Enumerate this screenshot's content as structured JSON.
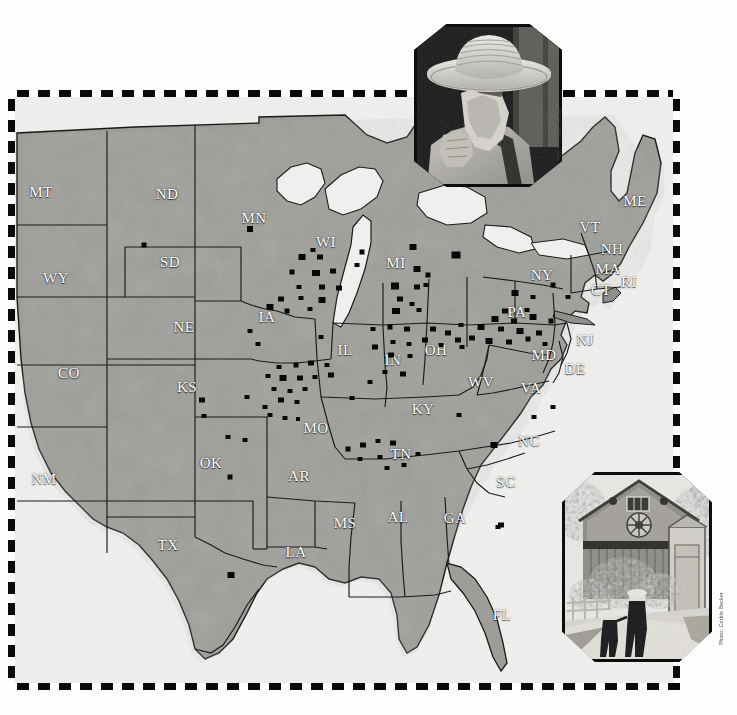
{
  "page": {
    "background_color": "#fdfdfd",
    "frame_color": "#0a0a0a",
    "land_color": "#9a9a96",
    "water_color": "#efefed",
    "dot_color": "#080808",
    "label_color": "#ffffff"
  },
  "map": {
    "name": "united-states-settlement-map",
    "projection_note": "contiguous united states",
    "state_labels": [
      {
        "abbr": "MT",
        "x": 26,
        "y": 95
      },
      {
        "abbr": "ND",
        "x": 152,
        "y": 97
      },
      {
        "abbr": "MN",
        "x": 239,
        "y": 121
      },
      {
        "abbr": "WI",
        "x": 311,
        "y": 145
      },
      {
        "abbr": "MI",
        "x": 381,
        "y": 166
      },
      {
        "abbr": "ME",
        "x": 620,
        "y": 104
      },
      {
        "abbr": "VT",
        "x": 575,
        "y": 130
      },
      {
        "abbr": "NH",
        "x": 597,
        "y": 152
      },
      {
        "abbr": "MA",
        "x": 593,
        "y": 172
      },
      {
        "abbr": "RI",
        "x": 614,
        "y": 185
      },
      {
        "abbr": "CT",
        "x": 586,
        "y": 193
      },
      {
        "abbr": "NY",
        "x": 527,
        "y": 178
      },
      {
        "abbr": "PA",
        "x": 502,
        "y": 215
      },
      {
        "abbr": "WY",
        "x": 41,
        "y": 181
      },
      {
        "abbr": "SD",
        "x": 155,
        "y": 165
      },
      {
        "abbr": "IA",
        "x": 252,
        "y": 220
      },
      {
        "abbr": "NE",
        "x": 169,
        "y": 230
      },
      {
        "abbr": "IL",
        "x": 330,
        "y": 253
      },
      {
        "abbr": "IN",
        "x": 378,
        "y": 263
      },
      {
        "abbr": "OH",
        "x": 421,
        "y": 253
      },
      {
        "abbr": "NJ",
        "x": 570,
        "y": 243
      },
      {
        "abbr": "MD",
        "x": 529,
        "y": 258
      },
      {
        "abbr": "DE",
        "x": 560,
        "y": 272
      },
      {
        "abbr": "WV",
        "x": 466,
        "y": 285
      },
      {
        "abbr": "VA",
        "x": 516,
        "y": 291
      },
      {
        "abbr": "CO",
        "x": 54,
        "y": 276
      },
      {
        "abbr": "KS",
        "x": 172,
        "y": 290
      },
      {
        "abbr": "MO",
        "x": 301,
        "y": 331
      },
      {
        "abbr": "KY",
        "x": 408,
        "y": 312
      },
      {
        "abbr": "TN",
        "x": 386,
        "y": 357
      },
      {
        "abbr": "NC",
        "x": 514,
        "y": 344
      },
      {
        "abbr": "SC",
        "x": 491,
        "y": 385
      },
      {
        "abbr": "NM",
        "x": 29,
        "y": 382
      },
      {
        "abbr": "OK",
        "x": 196,
        "y": 366
      },
      {
        "abbr": "AR",
        "x": 284,
        "y": 379
      },
      {
        "abbr": "TX",
        "x": 153,
        "y": 448
      },
      {
        "abbr": "LA",
        "x": 281,
        "y": 455
      },
      {
        "abbr": "MS",
        "x": 330,
        "y": 426
      },
      {
        "abbr": "AL",
        "x": 383,
        "y": 420
      },
      {
        "abbr": "GA",
        "x": 440,
        "y": 421
      },
      {
        "abbr": "FL",
        "x": 487,
        "y": 518
      }
    ],
    "settlement_dots": [
      {
        "x": 235,
        "y": 132,
        "w": 6,
        "h": 6
      },
      {
        "x": 129,
        "y": 148,
        "w": 5,
        "h": 5
      },
      {
        "x": 287,
        "y": 160,
        "w": 7,
        "h": 6
      },
      {
        "x": 305,
        "y": 160,
        "w": 6,
        "h": 5
      },
      {
        "x": 298,
        "y": 153,
        "w": 5,
        "h": 4
      },
      {
        "x": 347,
        "y": 155,
        "w": 5,
        "h": 5
      },
      {
        "x": 441,
        "y": 158,
        "w": 9,
        "h": 7
      },
      {
        "x": 398,
        "y": 150,
        "w": 7,
        "h": 6
      },
      {
        "x": 301,
        "y": 176,
        "w": 8,
        "h": 6
      },
      {
        "x": 318,
        "y": 174,
        "w": 6,
        "h": 5
      },
      {
        "x": 277,
        "y": 175,
        "w": 5,
        "h": 5
      },
      {
        "x": 342,
        "y": 168,
        "w": 5,
        "h": 4
      },
      {
        "x": 402,
        "y": 172,
        "w": 7,
        "h": 6
      },
      {
        "x": 413,
        "y": 178,
        "w": 5,
        "h": 5
      },
      {
        "x": 284,
        "y": 190,
        "w": 5,
        "h": 4
      },
      {
        "x": 307,
        "y": 190,
        "w": 6,
        "h": 5
      },
      {
        "x": 324,
        "y": 191,
        "w": 6,
        "h": 5
      },
      {
        "x": 380,
        "y": 189,
        "w": 8,
        "h": 7
      },
      {
        "x": 402,
        "y": 190,
        "w": 6,
        "h": 5
      },
      {
        "x": 411,
        "y": 188,
        "w": 5,
        "h": 4
      },
      {
        "x": 266,
        "y": 202,
        "w": 6,
        "h": 5
      },
      {
        "x": 286,
        "y": 201,
        "w": 5,
        "h": 4
      },
      {
        "x": 307,
        "y": 203,
        "w": 7,
        "h": 6
      },
      {
        "x": 385,
        "y": 202,
        "w": 6,
        "h": 5
      },
      {
        "x": 397,
        "y": 207,
        "w": 5,
        "h": 4
      },
      {
        "x": 255,
        "y": 210,
        "w": 7,
        "h": 6
      },
      {
        "x": 272,
        "y": 214,
        "w": 5,
        "h": 5
      },
      {
        "x": 295,
        "y": 212,
        "w": 5,
        "h": 4
      },
      {
        "x": 381,
        "y": 214,
        "w": 8,
        "h": 6
      },
      {
        "x": 404,
        "y": 213,
        "w": 5,
        "h": 4
      },
      {
        "x": 500,
        "y": 196,
        "w": 7,
        "h": 6
      },
      {
        "x": 518,
        "y": 200,
        "w": 5,
        "h": 4
      },
      {
        "x": 538,
        "y": 188,
        "w": 5,
        "h": 5
      },
      {
        "x": 553,
        "y": 200,
        "w": 5,
        "h": 4
      },
      {
        "x": 490,
        "y": 214,
        "w": 6,
        "h": 5
      },
      {
        "x": 512,
        "y": 213,
        "w": 5,
        "h": 4
      },
      {
        "x": 480,
        "y": 222,
        "w": 7,
        "h": 6
      },
      {
        "x": 499,
        "y": 224,
        "w": 6,
        "h": 5
      },
      {
        "x": 518,
        "y": 220,
        "w": 7,
        "h": 6
      },
      {
        "x": 536,
        "y": 224,
        "w": 5,
        "h": 5
      },
      {
        "x": 466,
        "y": 230,
        "w": 7,
        "h": 6
      },
      {
        "x": 486,
        "y": 232,
        "w": 6,
        "h": 5
      },
      {
        "x": 505,
        "y": 234,
        "w": 7,
        "h": 6
      },
      {
        "x": 524,
        "y": 236,
        "w": 6,
        "h": 5
      },
      {
        "x": 474,
        "y": 244,
        "w": 7,
        "h": 6
      },
      {
        "x": 494,
        "y": 245,
        "w": 6,
        "h": 5
      },
      {
        "x": 513,
        "y": 242,
        "w": 5,
        "h": 5
      },
      {
        "x": 530,
        "y": 247,
        "w": 5,
        "h": 4
      },
      {
        "x": 457,
        "y": 241,
        "w": 6,
        "h": 5
      },
      {
        "x": 447,
        "y": 250,
        "w": 5,
        "h": 4
      },
      {
        "x": 418,
        "y": 232,
        "w": 6,
        "h": 5
      },
      {
        "x": 433,
        "y": 236,
        "w": 6,
        "h": 5
      },
      {
        "x": 446,
        "y": 228,
        "w": 5,
        "h": 4
      },
      {
        "x": 426,
        "y": 248,
        "w": 5,
        "h": 4
      },
      {
        "x": 443,
        "y": 243,
        "w": 6,
        "h": 5
      },
      {
        "x": 410,
        "y": 243,
        "w": 6,
        "h": 5
      },
      {
        "x": 392,
        "y": 232,
        "w": 6,
        "h": 5
      },
      {
        "x": 375,
        "y": 230,
        "w": 5,
        "h": 5
      },
      {
        "x": 358,
        "y": 232,
        "w": 5,
        "h": 4
      },
      {
        "x": 378,
        "y": 245,
        "w": 5,
        "h": 4
      },
      {
        "x": 394,
        "y": 247,
        "w": 5,
        "h": 4
      },
      {
        "x": 360,
        "y": 250,
        "w": 6,
        "h": 5
      },
      {
        "x": 376,
        "y": 258,
        "w": 6,
        "h": 5
      },
      {
        "x": 395,
        "y": 259,
        "w": 5,
        "h": 4
      },
      {
        "x": 370,
        "y": 275,
        "w": 5,
        "h": 4
      },
      {
        "x": 388,
        "y": 277,
        "w": 6,
        "h": 5
      },
      {
        "x": 355,
        "y": 285,
        "w": 5,
        "h": 4
      },
      {
        "x": 264,
        "y": 270,
        "w": 5,
        "h": 4
      },
      {
        "x": 281,
        "y": 268,
        "w": 5,
        "h": 5
      },
      {
        "x": 296,
        "y": 266,
        "w": 6,
        "h": 5
      },
      {
        "x": 312,
        "y": 268,
        "w": 5,
        "h": 4
      },
      {
        "x": 253,
        "y": 279,
        "w": 5,
        "h": 4
      },
      {
        "x": 268,
        "y": 281,
        "w": 7,
        "h": 6
      },
      {
        "x": 285,
        "y": 281,
        "w": 6,
        "h": 5
      },
      {
        "x": 300,
        "y": 280,
        "w": 5,
        "h": 4
      },
      {
        "x": 316,
        "y": 278,
        "w": 6,
        "h": 5
      },
      {
        "x": 259,
        "y": 292,
        "w": 5,
        "h": 4
      },
      {
        "x": 275,
        "y": 294,
        "w": 5,
        "h": 4
      },
      {
        "x": 290,
        "y": 292,
        "w": 5,
        "h": 4
      },
      {
        "x": 266,
        "y": 303,
        "w": 6,
        "h": 5
      },
      {
        "x": 282,
        "y": 305,
        "w": 5,
        "h": 4
      },
      {
        "x": 250,
        "y": 310,
        "w": 5,
        "h": 4
      },
      {
        "x": 255,
        "y": 318,
        "w": 5,
        "h": 4
      },
      {
        "x": 270,
        "y": 321,
        "w": 5,
        "h": 4
      },
      {
        "x": 283,
        "y": 322,
        "w": 4,
        "h": 4
      },
      {
        "x": 187,
        "y": 303,
        "w": 6,
        "h": 5
      },
      {
        "x": 232,
        "y": 300,
        "w": 5,
        "h": 4
      },
      {
        "x": 189,
        "y": 319,
        "w": 5,
        "h": 4
      },
      {
        "x": 213,
        "y": 340,
        "w": 5,
        "h": 4
      },
      {
        "x": 230,
        "y": 343,
        "w": 5,
        "h": 4
      },
      {
        "x": 216,
        "y": 478,
        "w": 7,
        "h": 6
      },
      {
        "x": 215,
        "y": 380,
        "w": 5,
        "h": 5
      },
      {
        "x": 333,
        "y": 352,
        "w": 5,
        "h": 5
      },
      {
        "x": 348,
        "y": 348,
        "w": 6,
        "h": 5
      },
      {
        "x": 363,
        "y": 344,
        "w": 5,
        "h": 4
      },
      {
        "x": 378,
        "y": 346,
        "w": 6,
        "h": 5
      },
      {
        "x": 345,
        "y": 362,
        "w": 5,
        "h": 4
      },
      {
        "x": 365,
        "y": 360,
        "w": 5,
        "h": 4
      },
      {
        "x": 372,
        "y": 371,
        "w": 5,
        "h": 4
      },
      {
        "x": 389,
        "y": 368,
        "w": 5,
        "h": 4
      },
      {
        "x": 403,
        "y": 357,
        "w": 5,
        "h": 4
      },
      {
        "x": 486,
        "y": 428,
        "w": 6,
        "h": 5
      },
      {
        "x": 483,
        "y": 430,
        "w": 5,
        "h": 4
      },
      {
        "x": 479,
        "y": 348,
        "w": 7,
        "h": 6
      },
      {
        "x": 519,
        "y": 320,
        "w": 5,
        "h": 4
      },
      {
        "x": 538,
        "y": 310,
        "w": 5,
        "h": 4
      },
      {
        "x": 444,
        "y": 318,
        "w": 5,
        "h": 4
      },
      {
        "x": 337,
        "y": 301,
        "w": 5,
        "h": 4
      },
      {
        "x": 306,
        "y": 240,
        "w": 5,
        "h": 4
      },
      {
        "x": 235,
        "y": 234,
        "w": 5,
        "h": 4
      },
      {
        "x": 243,
        "y": 247,
        "w": 5,
        "h": 4
      }
    ]
  },
  "photos": [
    {
      "name": "amish-man-with-straw-hat",
      "description": "Amish man in broad-brimmed straw hat with long grey beard and suspenders",
      "credit": "Photo: Corbis Becker"
    },
    {
      "name": "barn-with-hex-sign-and-children",
      "description": "Two Amish children walking on a dirt lane toward a barn with a hex sign",
      "credit": "Photo: Corbis Becker"
    }
  ]
}
